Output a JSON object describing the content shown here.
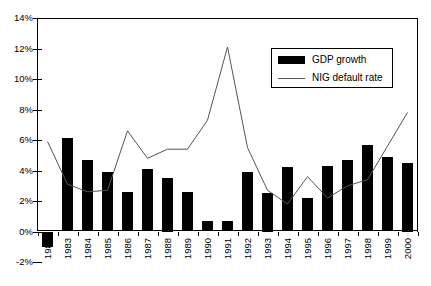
{
  "chart_data": {
    "type": "bar",
    "title": "",
    "subtitle": "",
    "xlabel": "",
    "ylabel": "",
    "ylim": [
      -2,
      14
    ],
    "ytick_labels": [
      "14%",
      "12%",
      "10%",
      "8%",
      "6%",
      "4%",
      "2%",
      "0%",
      "-2%"
    ],
    "ytick_values": [
      14,
      12,
      10,
      8,
      6,
      4,
      2,
      0,
      -2
    ],
    "grid": false,
    "legend_position": "top-right",
    "categories": [
      "1982",
      "1983",
      "1984",
      "1985",
      "1986",
      "1987",
      "1988",
      "1989",
      "1990",
      "1991",
      "1992",
      "1993",
      "1994",
      "1995",
      "1996",
      "1997",
      "1998",
      "1999",
      "2000"
    ],
    "series": [
      {
        "name": "GDP growth",
        "type": "bar",
        "color": "#000000",
        "values": [
          -1.0,
          6.1,
          4.7,
          3.9,
          2.6,
          4.1,
          3.5,
          2.6,
          0.7,
          0.7,
          3.9,
          2.5,
          4.2,
          2.2,
          4.3,
          4.7,
          5.7,
          4.9,
          4.5
        ]
      },
      {
        "name": "NIG default rate",
        "type": "line",
        "color": "#555555",
        "values": [
          5.9,
          3.1,
          2.6,
          2.7,
          6.6,
          4.8,
          5.4,
          5.4,
          7.3,
          12.1,
          5.5,
          2.7,
          1.8,
          3.6,
          2.2,
          3.0,
          3.4,
          5.6,
          7.8
        ]
      }
    ]
  },
  "legend": {
    "items": [
      {
        "label": "GDP growth",
        "marker": "bar-swatch"
      },
      {
        "label": "NIG default rate",
        "marker": "line-swatch"
      }
    ]
  }
}
